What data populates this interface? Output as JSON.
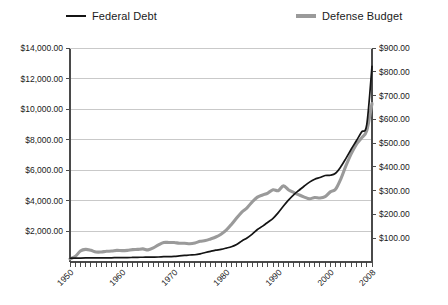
{
  "chart_data": {
    "type": "line",
    "title": "",
    "xlabel": "",
    "ylabel": "",
    "grid": true,
    "legend_position": "top",
    "x": [
      1950,
      1951,
      1952,
      1953,
      1954,
      1955,
      1956,
      1957,
      1958,
      1959,
      1960,
      1961,
      1962,
      1963,
      1964,
      1965,
      1966,
      1967,
      1968,
      1969,
      1970,
      1971,
      1972,
      1973,
      1974,
      1975,
      1976,
      1977,
      1978,
      1979,
      1980,
      1981,
      1982,
      1983,
      1984,
      1985,
      1986,
      1987,
      1988,
      1989,
      1990,
      1991,
      1992,
      1993,
      1994,
      1995,
      1996,
      1997,
      1998,
      1999,
      2000,
      2001,
      2002,
      2003,
      2004,
      2005,
      2006,
      2007,
      2008
    ],
    "xtick_labels": [
      "1950",
      "1960",
      "1970",
      "1980",
      "1990",
      "2000",
      "2008"
    ],
    "xtick_values": [
      1950,
      1960,
      1970,
      1980,
      1990,
      2000,
      2008
    ],
    "xlim": [
      1950,
      2008
    ],
    "axes": [
      {
        "id": "left",
        "name": "Federal Debt axis",
        "ylim": [
          0,
          14000
        ],
        "ticks": [
          2000,
          4000,
          6000,
          8000,
          10000,
          12000,
          14000
        ],
        "tick_labels": [
          "$2,000.00",
          "$4,000.00",
          "$6,000.00",
          "$8,000.00",
          "$10,000.00",
          "$12,000.00",
          "$14,000.00"
        ]
      },
      {
        "id": "right",
        "name": "Defense Budget axis",
        "ylim": [
          0,
          900
        ],
        "ticks": [
          100,
          200,
          300,
          400,
          500,
          600,
          700,
          800,
          900
        ],
        "tick_labels": [
          "$100.00",
          "$200.00",
          "$300.00",
          "$400.00",
          "$500.00",
          "$600.00",
          "$700.00",
          "$800.00",
          "$900.00"
        ]
      }
    ],
    "series": [
      {
        "name": "Federal Debt",
        "axis": "left",
        "color": "#141414",
        "line_width": 1.7,
        "values": [
          257,
          255,
          259,
          266,
          271,
          274,
          273,
          271,
          276,
          285,
          286,
          289,
          298,
          306,
          312,
          317,
          320,
          326,
          348,
          354,
          371,
          398,
          427,
          458,
          475,
          533,
          620,
          699,
          772,
          827,
          908,
          998,
          1142,
          1377,
          1572,
          1823,
          2125,
          2350,
          2602,
          2857,
          3233,
          3665,
          4065,
          4411,
          4693,
          4974,
          5225,
          5413,
          5526,
          5656,
          5674,
          5807,
          6228,
          6783,
          7379,
          7933,
          8507,
          9008,
          12800
        ]
      },
      {
        "name": "Defense Budget",
        "axis": "right",
        "color": "#9a9a9a",
        "line_width": 3.1,
        "values": [
          13,
          23,
          46,
          53,
          49,
          42,
          42,
          45,
          46,
          49,
          48,
          49,
          52,
          53,
          55,
          51,
          59,
          72,
          82,
          82,
          82,
          79,
          79,
          77,
          80,
          87,
          90,
          97,
          105,
          117,
          134,
          158,
          185,
          210,
          228,
          253,
          273,
          282,
          290,
          304,
          300,
          320,
          303,
          292,
          282,
          273,
          266,
          271,
          269,
          275,
          295,
          306,
          349,
          405,
          455,
          495,
          522,
          553,
          666
        ]
      }
    ]
  }
}
